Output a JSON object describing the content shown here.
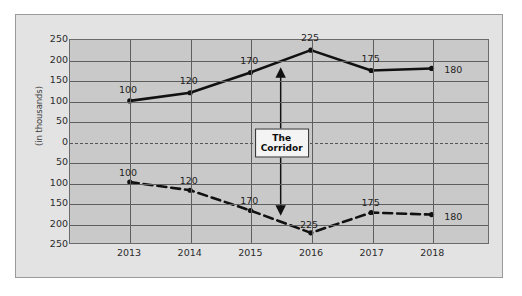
{
  "chart_data": {
    "type": "line",
    "title": "",
    "subtitle": "",
    "xlabel": "",
    "ylabel": "(in thousands)",
    "categories": [
      "2013",
      "2014",
      "2015",
      "2016",
      "2017",
      "2018"
    ],
    "series": [
      {
        "name": "upper-band",
        "style": "solid",
        "color": "#111111",
        "values": [
          100,
          120,
          170,
          225,
          175,
          180
        ],
        "labels": [
          "100",
          "120",
          "170",
          "225",
          "175",
          "180"
        ]
      },
      {
        "name": "lower-band",
        "style": "dashed",
        "color": "#111111",
        "values": [
          -100,
          -120,
          -170,
          -225,
          -175,
          -180
        ],
        "labels": [
          "100",
          "120",
          "170",
          "225",
          "175",
          "180"
        ]
      }
    ],
    "ylim": [
      -250,
      250
    ],
    "y_ticks": [
      250,
      200,
      150,
      100,
      50,
      0,
      50,
      100,
      150,
      200,
      250
    ],
    "y_tick_values": [
      250,
      200,
      150,
      100,
      50,
      0,
      -50,
      -100,
      -150,
      -200,
      -250
    ],
    "grid": true,
    "legend": "none",
    "zero_line_style": "dashed",
    "annotations": [
      {
        "name": "corridor",
        "text_line1": "The",
        "text_line2": "Corridor",
        "x_category": "2015-2016 midpoint",
        "arrow": "double-headed-vertical",
        "arrow_from": 170,
        "arrow_to": -170
      }
    ],
    "colors": {
      "plot_background": "#c9c9c9",
      "panel_background": "#e3e3e3",
      "page_background": "#ffffff",
      "gridline": "#5e5e5e",
      "series_line": "#111111",
      "panel_border": "#9a9a9a"
    }
  }
}
